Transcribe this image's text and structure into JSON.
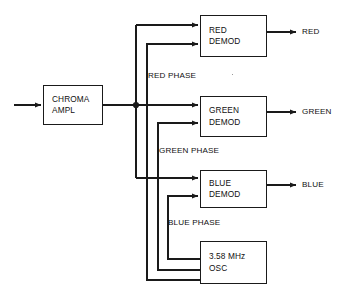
{
  "diagram": {
    "type": "block-diagram",
    "line_color": "#1a1a1a",
    "background": "#ffffff",
    "blocks": [
      {
        "id": "chroma-ampl",
        "line1": "CHROMA",
        "line2": "AMPL",
        "x": 43,
        "y": 85,
        "w": 60,
        "h": 40
      },
      {
        "id": "red-demod",
        "line1": "RED",
        "line2": "DEMOD",
        "x": 200,
        "y": 15,
        "w": 67,
        "h": 42
      },
      {
        "id": "green-demod",
        "line1": "GREEN",
        "line2": "DEMOD",
        "x": 200,
        "y": 96,
        "w": 67,
        "h": 41
      },
      {
        "id": "blue-demod",
        "line1": "BLUE",
        "line2": "DEMOD",
        "x": 200,
        "y": 170,
        "w": 67,
        "h": 38
      },
      {
        "id": "osc",
        "line1": "3.58 MHz",
        "line2": "OSC",
        "x": 200,
        "y": 241,
        "w": 67,
        "h": 43
      }
    ],
    "signal_labels": [
      {
        "id": "red-phase",
        "text": "RED PHASE",
        "x": 148,
        "y": 71
      },
      {
        "id": "green-phase",
        "text": "GREEN PHASE",
        "x": 159,
        "y": 146
      },
      {
        "id": "blue-phase",
        "text": "BLUE PHASE",
        "x": 168,
        "y": 218
      }
    ],
    "output_labels": [
      {
        "id": "red-output",
        "text": "RED",
        "x": 302,
        "y": 32
      },
      {
        "id": "green-output",
        "text": "GREEN",
        "x": 302,
        "y": 112
      },
      {
        "id": "blue-output",
        "text": "BLUE",
        "x": 302,
        "y": 185
      }
    ],
    "junction": {
      "x": 136,
      "y": 105
    },
    "input_arrow": {
      "from_x": 14,
      "to_x": 43,
      "y": 105
    }
  }
}
